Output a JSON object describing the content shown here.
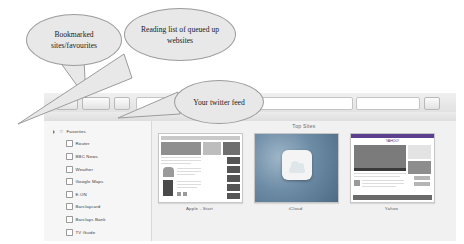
{
  "browser": {
    "toolbar": {
      "sidebar_toggle_icon": "sidebar-icon",
      "back_forward_icon": "back-forward-icon",
      "share_icon": "share-icon",
      "address_value": "",
      "address_placeholder": "",
      "search_placeholder": "",
      "downloads_icon": "downloads-icon"
    },
    "sidebar": {
      "header": {
        "label": "Favorites",
        "disclosure_icon": "disclosure-triangle-icon",
        "icon": "star-icon"
      },
      "items": [
        {
          "label": "Router",
          "icon": "bookmark-icon"
        },
        {
          "label": "BBC News",
          "icon": "bookmark-icon"
        },
        {
          "label": "Weather",
          "icon": "bookmark-icon"
        },
        {
          "label": "Google Maps",
          "icon": "bookmark-icon"
        },
        {
          "label": "E.ON",
          "icon": "bookmark-icon"
        },
        {
          "label": "Barclaycard",
          "icon": "bookmark-icon"
        },
        {
          "label": "Barclays Bank",
          "icon": "bookmark-icon"
        },
        {
          "label": "TV Guide",
          "icon": "bookmark-icon"
        }
      ]
    },
    "content": {
      "title": "Top Sites",
      "thumbnails": [
        {
          "label": "Apple - Start"
        },
        {
          "label": "iCloud"
        },
        {
          "label": "Yahoo"
        }
      ]
    }
  },
  "annotations": [
    {
      "id": "bookmarks",
      "text": "Bookmarked sites/favourites"
    },
    {
      "id": "reading",
      "text": "Reading list of queued up websites"
    },
    {
      "id": "twitter",
      "text": "Your twitter feed"
    }
  ],
  "colors": {
    "bubble_fill": "#e8e8e8",
    "bubble_stroke": "#9c9c9c",
    "window_chrome": "#f0f0f0",
    "content_bg": "#f1f1f1"
  }
}
